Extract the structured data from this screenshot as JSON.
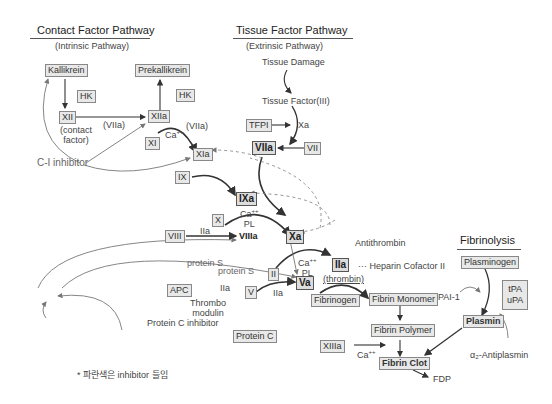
{
  "headers": {
    "contact": {
      "title": "Contact Factor Pathway",
      "subtitle": "(Intrinsic Pathway)"
    },
    "tissue": {
      "title": "Tissue Factor Pathway",
      "subtitle": "(Extrinsic Pathway)"
    },
    "fibrinolysis": {
      "title": "Fibrinolysis"
    }
  },
  "nodes": {
    "kallikrein": "Kallikrein",
    "prekallikrein": "Prekallikrein",
    "hk1": "HK",
    "hk2": "HK",
    "xii": "XII",
    "contact_factor": "(contact\nfactor)",
    "xiia": "XIIa",
    "viia_label1": "(VIIa)",
    "xi": "XI",
    "ca1": "Ca",
    "viia_label2": "(VIIa)",
    "xia": "XIa",
    "c1_inhibitor": "C-I inhibitor",
    "tissue_damage": "Tissue Damage",
    "tissue_factor": "Tissue Factor(III)",
    "tfpi": "TFPI",
    "xa_top": "Xa",
    "viia": "VIIa",
    "vii": "VII",
    "ix": "IX",
    "ixa": "IXa",
    "x": "X",
    "ca_pl_1_ca": "Ca",
    "ca_pl_1_pl": "PL",
    "xa": "Xa",
    "viii": "VIII",
    "iia_1": "IIa",
    "viiia": "VIIIa",
    "antithrombin": "Antithrombin",
    "protein_s_1": "protein S",
    "protein_s_2": "protein S",
    "ii": "II",
    "ca_pl_2_ca": "Ca",
    "ca_pl_2_pl": "PL",
    "iia": "IIa",
    "heparin_cofactor": "··· Heparin Cofactor II",
    "thrombin": "(thrombin)",
    "apc": "APC",
    "iia_2": "IIa",
    "v": "V",
    "iia_3": "IIa",
    "va": "Va",
    "thrombomodulin": "Thrombo\nmodulin",
    "protein_c_inhibitor": "Protein C inhibitor",
    "protein_c": "Protein C",
    "fibrinogen": "Fibrinogen",
    "fibrin_monomer": "Fibrin Monomer",
    "fibrin_polymer": "Fibrin Polymer",
    "xiiia": "XIIIa",
    "ca3": "Ca",
    "fibrin_clot": "Fibrin Clot",
    "fdp": "FDP",
    "plasminogen": "Plasminogen",
    "pai1": "PAI-1",
    "tpa": "tPA",
    "upa": "uPA",
    "plasmin": "Plasmin",
    "antiplasmin": "α₂-Antiplasmin"
  },
  "superscripts": {
    "ca": "++"
  },
  "footnote": "* 파란색은 inhibitor 들임",
  "colors": {
    "line": "#333333",
    "inhibitor_line": "#888888",
    "box_fill": "#e8e8e8",
    "box_border": "#888888"
  }
}
